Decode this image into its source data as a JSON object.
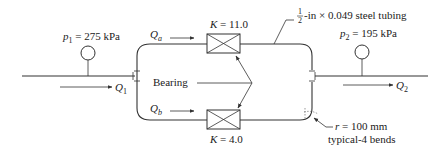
{
  "diagram": {
    "inlet": {
      "pressure_symbol": "p",
      "pressure_sub": "1",
      "pressure_value": " = 275 kPa",
      "flow_symbol": "Q",
      "flow_sub": "1"
    },
    "outlet": {
      "pressure_symbol": "p",
      "pressure_sub": "2",
      "pressure_value": " = 195 kPa",
      "flow_symbol": "Q",
      "flow_sub": "2"
    },
    "branch_a": {
      "flow_symbol": "Q",
      "flow_sub": "a",
      "k_label": "K",
      "k_value": " = 11.0"
    },
    "branch_b": {
      "flow_symbol": "Q",
      "flow_sub": "b",
      "k_label": "K",
      "k_value": " = 4.0"
    },
    "bearing_label": "Bearing",
    "tubing": {
      "frac_num": "1",
      "frac_den": "2",
      "spec": "-in × 0.049 steel tubing"
    },
    "bend": {
      "radius_symbol": "r",
      "radius_value": " = 100 mm",
      "note": "typical-4 bends"
    },
    "colors": {
      "line": "#333333",
      "text": "#222222",
      "background": "#ffffff"
    }
  }
}
